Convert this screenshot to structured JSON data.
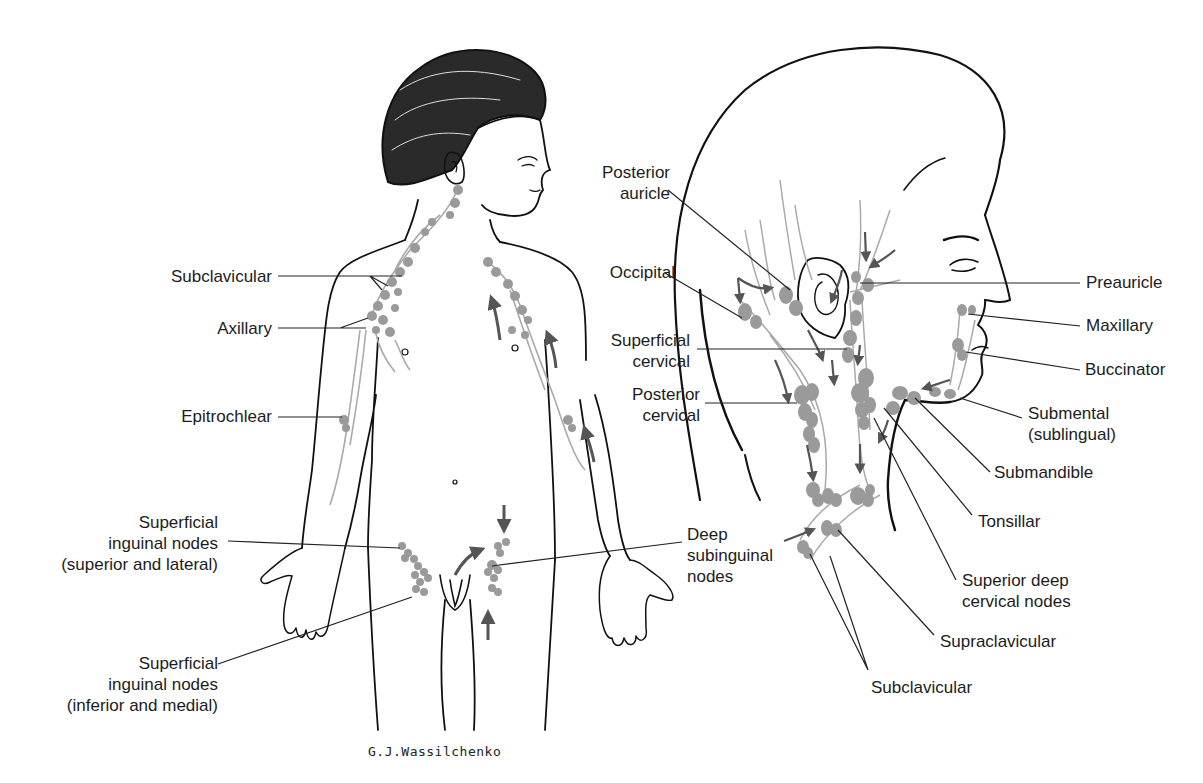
{
  "figure": {
    "signature": "G.J.Wassilchenko",
    "colors": {
      "outline": "#111111",
      "node": "#9a9a9a",
      "vessel": "#a8a8a8",
      "arrow": "#555555",
      "leader": "#222222",
      "background": "#ffffff"
    }
  },
  "body_view": {
    "labels": [
      {
        "id": "subclavicular",
        "text": "Subclavicular",
        "x": 150,
        "y": 266,
        "w": 122,
        "align": "r"
      },
      {
        "id": "axillary",
        "text": "Axillary",
        "x": 150,
        "y": 318,
        "w": 122,
        "align": "r"
      },
      {
        "id": "epitrochlear",
        "text": "Epitrochlear",
        "x": 130,
        "y": 406,
        "w": 142,
        "align": "r"
      },
      {
        "id": "superficial-inguinal-superior-lateral",
        "text": "Superficial\ninguinal nodes\n(superior and lateral)",
        "x": 20,
        "y": 512,
        "w": 198,
        "align": "r"
      },
      {
        "id": "superficial-inguinal-inferior-medial",
        "text": "Superficial\ninguinal nodes\n(inferior and medial)",
        "x": 20,
        "y": 653,
        "w": 198,
        "align": "r"
      },
      {
        "id": "deep-subinguinal",
        "text": "Deep\nsubinguinal\nnodes",
        "x": 687,
        "y": 524,
        "w": 110,
        "align": "l"
      }
    ]
  },
  "head_view": {
    "labels": [
      {
        "id": "posterior-auricle",
        "text": "Posterior\nauricle",
        "x": 560,
        "y": 162,
        "w": 110,
        "align": "r"
      },
      {
        "id": "occipital",
        "text": "Occipital",
        "x": 555,
        "y": 262,
        "w": 120,
        "align": "r"
      },
      {
        "id": "superficial-cervical",
        "text": "Superficial\ncervical",
        "x": 580,
        "y": 330,
        "w": 110,
        "align": "r"
      },
      {
        "id": "posterior-cervical",
        "text": "Posterior\ncervical",
        "x": 590,
        "y": 384,
        "w": 110,
        "align": "r"
      },
      {
        "id": "preauricle",
        "text": "Preauricle",
        "x": 1086,
        "y": 272,
        "w": 110,
        "align": "l"
      },
      {
        "id": "maxillary",
        "text": "Maxillary",
        "x": 1086,
        "y": 315,
        "w": 110,
        "align": "l"
      },
      {
        "id": "buccinator",
        "text": "Buccinator",
        "x": 1085,
        "y": 359,
        "w": 110,
        "align": "l"
      },
      {
        "id": "submental",
        "text": "Submental\n(sublingual)",
        "x": 1028,
        "y": 403,
        "w": 130,
        "align": "l"
      },
      {
        "id": "submandible",
        "text": "Submandible",
        "x": 994,
        "y": 462,
        "w": 130,
        "align": "l"
      },
      {
        "id": "tonsillar",
        "text": "Tonsillar",
        "x": 978,
        "y": 511,
        "w": 110,
        "align": "l"
      },
      {
        "id": "superior-deep-cervical",
        "text": "Superior deep\ncervical nodes",
        "x": 962,
        "y": 570,
        "w": 140,
        "align": "l"
      },
      {
        "id": "supraclavicular",
        "text": "Supraclavicular",
        "x": 940,
        "y": 631,
        "w": 150,
        "align": "l"
      },
      {
        "id": "subclavicular-head",
        "text": "Subclavicular",
        "x": 871,
        "y": 677,
        "w": 130,
        "align": "l"
      }
    ]
  }
}
